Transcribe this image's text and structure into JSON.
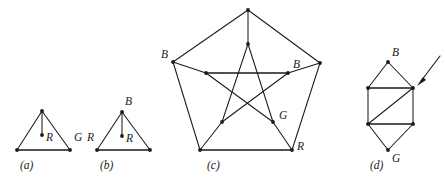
{
  "figure": {
    "type": "graph-coloring-diagram",
    "background_color": "#ffffff",
    "ink_color": "#1a1a1a",
    "panels": [
      {
        "id": "a",
        "caption": "(a)",
        "caption_pos": {
          "x": 20,
          "y": 169
        },
        "shape": "triangle-with-center-vertex",
        "vertices": [
          {
            "name": "apex",
            "x": 42,
            "y": 111
          },
          {
            "name": "left",
            "x": 17,
            "y": 150
          },
          {
            "name": "right",
            "x": 70,
            "y": 150
          },
          {
            "name": "center",
            "x": 42,
            "y": 135
          }
        ],
        "edges": [
          [
            "apex",
            "left"
          ],
          [
            "apex",
            "right"
          ],
          [
            "left",
            "right"
          ],
          [
            "apex",
            "center"
          ]
        ],
        "labels": [
          {
            "text": "R",
            "x": 46,
            "y": 141
          },
          {
            "text": "G",
            "x": 74,
            "y": 141
          }
        ]
      },
      {
        "id": "b",
        "caption": "(b)",
        "caption_pos": {
          "x": 100,
          "y": 169
        },
        "shape": "triangle-with-center-vertex",
        "vertices": [
          {
            "name": "apex",
            "x": 122,
            "y": 112
          },
          {
            "name": "left",
            "x": 97,
            "y": 150
          },
          {
            "name": "right",
            "x": 150,
            "y": 150
          },
          {
            "name": "center",
            "x": 122,
            "y": 136
          }
        ],
        "edges": [
          [
            "apex",
            "left"
          ],
          [
            "apex",
            "right"
          ],
          [
            "left",
            "right"
          ],
          [
            "apex",
            "center"
          ]
        ],
        "labels": [
          {
            "text": "B",
            "x": 125,
            "y": 105
          },
          {
            "text": "R",
            "x": 89,
            "y": 141
          },
          {
            "text": "R",
            "x": 126,
            "y": 142
          }
        ]
      },
      {
        "id": "c",
        "caption": "(c)",
        "caption_pos": {
          "x": 207,
          "y": 169
        },
        "shape": "petersen-graph",
        "vertices": [
          {
            "name": "outer-top",
            "x": 248,
            "y": 10
          },
          {
            "name": "outer-upper-left",
            "x": 173,
            "y": 62
          },
          {
            "name": "outer-upper-right",
            "x": 320,
            "y": 63
          },
          {
            "name": "outer-lower-left",
            "x": 200,
            "y": 150
          },
          {
            "name": "outer-lower-right",
            "x": 292,
            "y": 150
          },
          {
            "name": "inner-top",
            "x": 248,
            "y": 44
          },
          {
            "name": "inner-upper-left",
            "x": 206,
            "y": 73
          },
          {
            "name": "inner-upper-right",
            "x": 288,
            "y": 73
          },
          {
            "name": "inner-lower-left",
            "x": 222,
            "y": 122
          },
          {
            "name": "inner-lower-right",
            "x": 273,
            "y": 122
          }
        ],
        "edges": [
          [
            "outer-top",
            "outer-upper-left"
          ],
          [
            "outer-top",
            "outer-upper-right"
          ],
          [
            "outer-upper-left",
            "outer-lower-left"
          ],
          [
            "outer-upper-right",
            "outer-lower-right"
          ],
          [
            "outer-lower-left",
            "outer-lower-right"
          ],
          [
            "outer-top",
            "inner-top"
          ],
          [
            "outer-upper-left",
            "inner-upper-left"
          ],
          [
            "outer-upper-right",
            "inner-upper-right"
          ],
          [
            "outer-lower-left",
            "inner-lower-left"
          ],
          [
            "outer-lower-right",
            "inner-lower-right"
          ],
          [
            "inner-top",
            "inner-lower-left"
          ],
          [
            "inner-top",
            "inner-lower-right"
          ],
          [
            "inner-upper-left",
            "inner-lower-right"
          ],
          [
            "inner-upper-right",
            "inner-lower-left"
          ],
          [
            "inner-upper-left",
            "inner-upper-right"
          ]
        ],
        "labels": [
          {
            "text": "B",
            "x": 163,
            "y": 57
          },
          {
            "text": "B",
            "x": 292,
            "y": 68
          },
          {
            "text": "G",
            "x": 278,
            "y": 119
          },
          {
            "text": "R",
            "x": 296,
            "y": 149
          }
        ]
      },
      {
        "id": "d",
        "caption": "(d)",
        "caption_pos": {
          "x": 370,
          "y": 169
        },
        "shape": "hexagon-with-chord",
        "vertices": [
          {
            "name": "top",
            "x": 388,
            "y": 62
          },
          {
            "name": "upper-left",
            "x": 368,
            "y": 88
          },
          {
            "name": "upper-right",
            "x": 413,
            "y": 88
          },
          {
            "name": "lower-left",
            "x": 368,
            "y": 124
          },
          {
            "name": "lower-right",
            "x": 413,
            "y": 124
          },
          {
            "name": "bottom",
            "x": 388,
            "y": 150
          }
        ],
        "edges": [
          [
            "top",
            "upper-left"
          ],
          [
            "top",
            "upper-right"
          ],
          [
            "upper-left",
            "upper-right"
          ],
          [
            "upper-left",
            "lower-left"
          ],
          [
            "upper-right",
            "lower-right"
          ],
          [
            "lower-left",
            "lower-right"
          ],
          [
            "lower-left",
            "upper-right"
          ],
          [
            "lower-left",
            "bottom"
          ],
          [
            "lower-right",
            "bottom"
          ]
        ],
        "labels": [
          {
            "text": "B",
            "x": 392,
            "y": 55
          },
          {
            "text": "G",
            "x": 392,
            "y": 161
          }
        ],
        "annotation": {
          "type": "arrow",
          "from": {
            "x": 440,
            "y": 57
          },
          "to": {
            "x": 419,
            "y": 84
          },
          "points_at": "upper-right"
        }
      }
    ]
  }
}
